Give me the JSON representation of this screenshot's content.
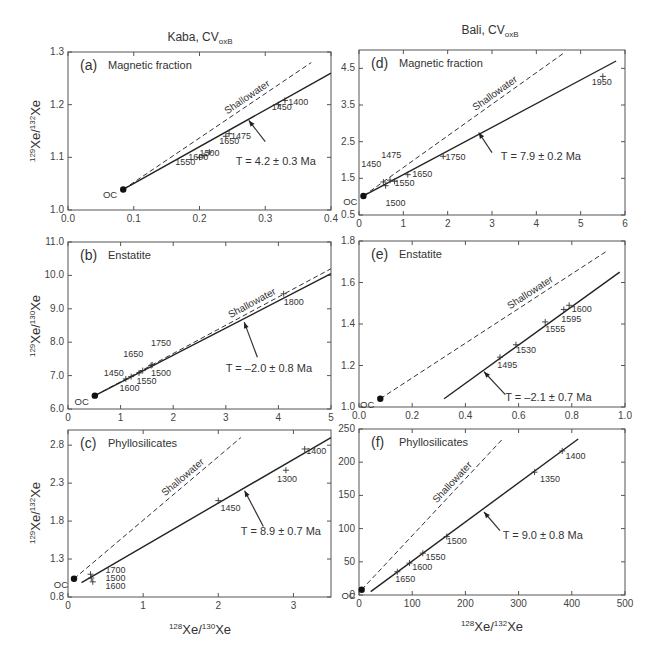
{
  "columns": [
    {
      "title": "Kaba, CV",
      "subscript": "oxB"
    },
    {
      "title": "Bali, CV",
      "subscript": "oxB"
    }
  ],
  "y_axis_titles": {
    "a": {
      "pre": "129",
      "mid": "Xe/",
      "pre2": "132",
      "post": "Xe"
    },
    "b": {
      "pre": "129",
      "mid": "Xe/",
      "pre2": "130",
      "post": "Xe"
    },
    "c": {
      "pre": "129",
      "mid": "Xe/",
      "pre2": "132",
      "post": "Xe"
    }
  },
  "x_axis_titles": {
    "left": {
      "pre": "128",
      "mid": "Xe/",
      "pre2": "130",
      "post": "Xe"
    },
    "right": {
      "pre": "128",
      "mid": "Xe/",
      "pre2": "132",
      "post": "Xe"
    }
  },
  "labels": {
    "shallowater": "Shallowater",
    "oc": "OC"
  },
  "chart_data": [
    {
      "id": "a",
      "type": "scatter",
      "panel_label": "(a)",
      "title": "Magnetic fraction",
      "column": "Kaba, CVoxB",
      "xlabel": "128Xe/130Xe",
      "ylabel": "129Xe/132Xe",
      "xlim": [
        0.0,
        0.4
      ],
      "ylim": [
        1.0,
        1.3
      ],
      "xticks": [
        "0.0",
        "0.1",
        "0.2",
        "0.3",
        "0.4"
      ],
      "yticks": [
        "1.0",
        "1.1",
        "1.2",
        "1.3"
      ],
      "oc_point": {
        "x": 0.084,
        "y": 1.039
      },
      "isochron": {
        "x": [
          0.084,
          0.4
        ],
        "y": [
          1.039,
          1.26
        ]
      },
      "shallowater": {
        "x": [
          0.084,
          0.37
        ],
        "y": [
          1.039,
          1.28
        ]
      },
      "annotation": "T = 4.2 ± 0.3 Ma",
      "annotation_arrow": {
        "from": {
          "x": 0.3,
          "y": 1.13
        },
        "to": {
          "x": 0.275,
          "y": 1.17
        }
      },
      "annotation_pos": {
        "x": 0.255,
        "y": 1.085
      },
      "points": [
        {
          "label": "1550",
          "x": 0.2,
          "y": 1.1,
          "lx": 0.163,
          "ly": 1.085
        },
        {
          "label": "1600",
          "x": 0.207,
          "y": 1.103,
          "lx": 0.183,
          "ly": 1.094
        },
        {
          "label": "1500",
          "x": 0.215,
          "y": 1.11,
          "lx": 0.2,
          "ly": 1.103
        },
        {
          "label": "1650",
          "x": 0.24,
          "y": 1.14,
          "lx": 0.23,
          "ly": 1.126
        },
        {
          "label": "1475",
          "x": 0.245,
          "y": 1.145,
          "lx": 0.248,
          "ly": 1.134
        },
        {
          "label": "1450",
          "x": 0.32,
          "y": 1.2,
          "lx": 0.31,
          "ly": 1.19
        },
        {
          "label": "1400",
          "x": 0.33,
          "y": 1.208,
          "lx": 0.335,
          "ly": 1.2
        }
      ]
    },
    {
      "id": "b",
      "type": "scatter",
      "panel_label": "(b)",
      "title": "Enstatite",
      "column": "Kaba, CVoxB",
      "xlabel": "128Xe/130Xe",
      "ylabel": "129Xe/130Xe",
      "xlim": [
        0,
        5
      ],
      "ylim": [
        6.0,
        11.0
      ],
      "xticks": [
        "0",
        "1",
        "2",
        "3",
        "4",
        "5"
      ],
      "yticks": [
        "6.0",
        "7.0",
        "8.0",
        "9.0",
        "10.0",
        "11.0"
      ],
      "oc_point": {
        "x": 0.51,
        "y": 6.4
      },
      "isochron": {
        "x": [
          0.51,
          5.0
        ],
        "y": [
          6.4,
          10.05
        ]
      },
      "shallowater": {
        "x": [
          0.51,
          5.0
        ],
        "y": [
          6.4,
          10.2
        ]
      },
      "annotation": "T = –2.0 ± 0.8 Ma",
      "annotation_arrow": {
        "from": {
          "x": 3.6,
          "y": 7.55
        },
        "to": {
          "x": 3.35,
          "y": 8.6
        }
      },
      "annotation_pos": {
        "x": 3.0,
        "y": 7.1
      },
      "points": [
        {
          "label": "1450",
          "x": 1.1,
          "y": 6.9,
          "lx": 0.68,
          "ly": 7.0
        },
        {
          "label": "1600",
          "x": 1.2,
          "y": 6.97,
          "lx": 0.98,
          "ly": 6.53
        },
        {
          "label": "1550",
          "x": 1.35,
          "y": 7.08,
          "lx": 1.3,
          "ly": 6.75
        },
        {
          "label": "1650",
          "x": 1.42,
          "y": 7.15,
          "lx": 1.05,
          "ly": 7.55
        },
        {
          "label": "1500",
          "x": 1.58,
          "y": 7.3,
          "lx": 1.58,
          "ly": 7.0
        },
        {
          "label": "1750",
          "x": 1.6,
          "y": 7.32,
          "lx": 1.58,
          "ly": 7.9
        },
        {
          "label": "1800",
          "x": 4.1,
          "y": 9.45,
          "lx": 4.1,
          "ly": 9.1
        }
      ]
    },
    {
      "id": "c",
      "type": "scatter",
      "panel_label": "(c)",
      "title": "Phyllosilicates",
      "column": "Kaba, CVoxB",
      "xlabel": "128Xe/130Xe",
      "ylabel": "129Xe/132Xe",
      "xlim": [
        0,
        3.5
      ],
      "ylim": [
        0.8,
        3.0
      ],
      "xticks": [
        "0",
        "1",
        "2",
        "3"
      ],
      "yticks": [
        "0.8",
        "1.3",
        "1.8",
        "2.3",
        "2.8"
      ],
      "oc_point": {
        "x": 0.08,
        "y": 1.04
      },
      "isochron": {
        "x": [
          0.18,
          3.5
        ],
        "y": [
          0.99,
          2.9
        ]
      },
      "shallowater": {
        "x": [
          0.08,
          2.3
        ],
        "y": [
          1.04,
          2.9
        ]
      },
      "annotation": "T = 8.9 ± 0.7 Ma",
      "annotation_arrow": {
        "from": {
          "x": 2.6,
          "y": 1.73
        },
        "to": {
          "x": 2.35,
          "y": 2.2
        }
      },
      "annotation_pos": {
        "x": 2.3,
        "y": 1.62
      },
      "points": [
        {
          "label": "1700",
          "x": 0.3,
          "y": 1.1,
          "lx": 0.5,
          "ly": 1.12
        },
        {
          "label": "1500",
          "x": 0.31,
          "y": 1.05,
          "lx": 0.5,
          "ly": 1.01
        },
        {
          "label": "1600",
          "x": 0.33,
          "y": 1.0,
          "lx": 0.5,
          "ly": 0.9
        },
        {
          "label": "1450",
          "x": 2.0,
          "y": 2.07,
          "lx": 2.03,
          "ly": 1.93
        },
        {
          "label": "1300",
          "x": 2.9,
          "y": 2.47,
          "lx": 2.78,
          "ly": 2.32
        },
        {
          "label": "1400",
          "x": 3.15,
          "y": 2.75,
          "lx": 3.17,
          "ly": 2.68
        }
      ]
    },
    {
      "id": "d",
      "type": "scatter",
      "panel_label": "(d)",
      "title": "Magnetic fraction",
      "column": "Bali, CVoxB",
      "xlabel": "128Xe/132Xe",
      "ylabel": "129Xe/132Xe",
      "xlim": [
        0,
        6
      ],
      "ylim": [
        0.5,
        5.0
      ],
      "xticks": [
        "0",
        "1",
        "2",
        "3",
        "4",
        "5",
        "6"
      ],
      "yticks": [
        "0.5",
        "1.5",
        "2.5",
        "3.5",
        "4.5"
      ],
      "oc_point": {
        "x": 0.1,
        "y": 1.02
      },
      "isochron": {
        "x": [
          0.1,
          5.8
        ],
        "y": [
          1.02,
          4.7
        ]
      },
      "shallowater": {
        "x": [
          0.1,
          4.6
        ],
        "y": [
          1.02,
          4.9
        ]
      },
      "annotation": "T = 7.9 ± 0.2 Ma",
      "annotation_arrow": {
        "from": {
          "x": 3.0,
          "y": 2.2
        },
        "to": {
          "x": 2.7,
          "y": 2.75
        }
      },
      "annotation_pos": {
        "x": 3.2,
        "y": 2.0
      },
      "points": [
        {
          "label": "1450",
          "x": 0.55,
          "y": 1.4,
          "lx": 0.05,
          "ly": 1.8
        },
        {
          "label": "1475",
          "x": 0.7,
          "y": 1.45,
          "lx": 0.5,
          "ly": 2.05
        },
        {
          "label": "1500",
          "x": 0.6,
          "y": 1.3,
          "lx": 0.6,
          "ly": 0.75
        },
        {
          "label": "1550",
          "x": 0.8,
          "y": 1.42,
          "lx": 0.8,
          "ly": 1.3
        },
        {
          "label": "1650",
          "x": 1.1,
          "y": 1.6,
          "lx": 1.2,
          "ly": 1.55
        },
        {
          "label": "1750",
          "x": 1.9,
          "y": 2.1,
          "lx": 1.95,
          "ly": 2.0
        },
        {
          "label": "1950",
          "x": 5.5,
          "y": 4.28,
          "lx": 5.25,
          "ly": 4.05
        }
      ]
    },
    {
      "id": "e",
      "type": "scatter",
      "panel_label": "(e)",
      "title": "Enstatite",
      "column": "Bali, CVoxB",
      "xlabel": "128Xe/132Xe",
      "ylabel": "129Xe/132Xe",
      "xlim": [
        0.0,
        1.0
      ],
      "ylim": [
        1.0,
        1.8
      ],
      "xticks": [
        "0.0",
        "0.2",
        "0.4",
        "0.6",
        "0.8",
        "1.0"
      ],
      "yticks": [
        "1.0",
        "1.2",
        "1.4",
        "1.6",
        "1.8"
      ],
      "oc_point": {
        "x": 0.08,
        "y": 1.04
      },
      "isochron": {
        "x": [
          0.32,
          0.98
        ],
        "y": [
          1.04,
          1.65
        ]
      },
      "shallowater": {
        "x": [
          0.08,
          0.93
        ],
        "y": [
          1.04,
          1.75
        ]
      },
      "annotation": "T = –2.1 ± 0.7 Ma",
      "annotation_arrow": {
        "from": {
          "x": 0.55,
          "y": 1.06
        },
        "to": {
          "x": 0.47,
          "y": 1.17
        }
      },
      "annotation_pos": {
        "x": 0.55,
        "y": 1.03
      },
      "points": [
        {
          "label": "1495",
          "x": 0.53,
          "y": 1.24,
          "lx": 0.52,
          "ly": 1.19
        },
        {
          "label": "1530",
          "x": 0.59,
          "y": 1.3,
          "lx": 0.59,
          "ly": 1.26
        },
        {
          "label": "1555",
          "x": 0.7,
          "y": 1.41,
          "lx": 0.7,
          "ly": 1.36
        },
        {
          "label": "1595",
          "x": 0.77,
          "y": 1.47,
          "lx": 0.76,
          "ly": 1.41
        },
        {
          "label": "1600",
          "x": 0.79,
          "y": 1.49,
          "lx": 0.8,
          "ly": 1.46
        }
      ]
    },
    {
      "id": "f",
      "type": "scatter",
      "panel_label": "(f)",
      "title": "Phyllosilicates",
      "column": "Bali, CVoxB",
      "xlabel": "128Xe/132Xe",
      "ylabel": "129Xe/132Xe",
      "xlim": [
        0,
        500
      ],
      "ylim": [
        0,
        250
      ],
      "xticks": [
        "0",
        "100",
        "200",
        "300",
        "400",
        "500"
      ],
      "yticks": [
        "0",
        "50",
        "100",
        "150",
        "200",
        "250"
      ],
      "oc_point": {
        "x": 5,
        "y": 8
      },
      "isochron": {
        "x": [
          22,
          412
        ],
        "y": [
          5,
          235
        ]
      },
      "shallowater": {
        "x": [
          5,
          270
        ],
        "y": [
          8,
          235
        ]
      },
      "annotation": "T = 9.0 ± 0.8 Ma",
      "annotation_arrow": {
        "from": {
          "x": 265,
          "y": 97
        },
        "to": {
          "x": 235,
          "y": 125
        }
      },
      "annotation_pos": {
        "x": 270,
        "y": 85
      },
      "points": [
        {
          "label": "1650",
          "x": 72,
          "y": 35,
          "lx": 68,
          "ly": 20
        },
        {
          "label": "1600",
          "x": 95,
          "y": 48,
          "lx": 100,
          "ly": 38
        },
        {
          "label": "1550",
          "x": 120,
          "y": 63,
          "lx": 125,
          "ly": 52
        },
        {
          "label": "1500",
          "x": 165,
          "y": 88,
          "lx": 165,
          "ly": 77
        },
        {
          "label": "1350",
          "x": 330,
          "y": 185,
          "lx": 340,
          "ly": 170
        },
        {
          "label": "1400",
          "x": 382,
          "y": 217,
          "lx": 388,
          "ly": 205
        }
      ]
    }
  ],
  "layout": {
    "panels": {
      "a": {
        "left": 68,
        "top": 52,
        "right": 331,
        "bottom": 210
      },
      "b": {
        "left": 68,
        "top": 242,
        "right": 331,
        "bottom": 409
      },
      "c": {
        "left": 68,
        "top": 430,
        "right": 331,
        "bottom": 597
      },
      "d": {
        "left": 359,
        "top": 50,
        "right": 625,
        "bottom": 215
      },
      "e": {
        "left": 359,
        "top": 241,
        "right": 625,
        "bottom": 407
      },
      "f": {
        "left": 359,
        "top": 429,
        "right": 625,
        "bottom": 595
      }
    }
  }
}
